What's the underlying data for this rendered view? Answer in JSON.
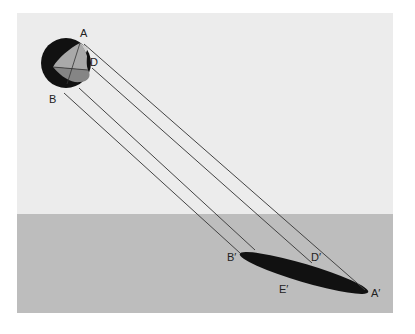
{
  "diagram": {
    "title": "",
    "colors": {
      "sky": "#ececec",
      "ground": "#bdbdbd",
      "sphere": "#111111",
      "face_light": "#a9a9a9",
      "face_dark": "#858585",
      "ray": "#444444",
      "shadow": "#111111"
    },
    "labels": {
      "A": "A",
      "B": "B",
      "D": "D",
      "A_prime": "A′",
      "B_prime": "B′",
      "D_prime": "D′",
      "E_prime": "E′"
    },
    "elements": {
      "sphere": "Dark sphere with cut-away face (points A, B, D)",
      "rays": "Four parallel projection rays from sphere to ground",
      "shadow": "Elongated elliptical shadow on ground plane (B′, D′, E′, A′)",
      "ground": "Ground plane"
    }
  }
}
